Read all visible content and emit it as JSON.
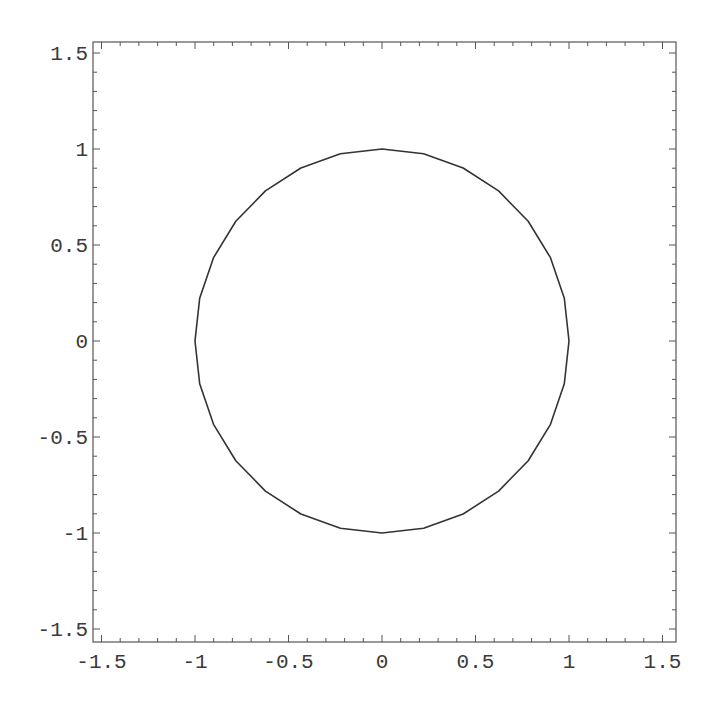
{
  "chart_data": {
    "type": "line",
    "title": "",
    "xlabel": "",
    "ylabel": "",
    "series": [
      {
        "name": "unit circle",
        "parametric": {
          "x": "cos(t)",
          "y": "sin(t)",
          "t_range": [
            0,
            6.2832
          ]
        },
        "segments": 28,
        "color": "#333333",
        "key_points": [
          {
            "x": 1,
            "y": 0
          },
          {
            "x": 0,
            "y": 1
          },
          {
            "x": -1,
            "y": 0
          },
          {
            "x": 0,
            "y": -1
          }
        ]
      }
    ],
    "xlim": [
      -1.55,
      1.57
    ],
    "ylim": [
      -1.57,
      1.56
    ],
    "xticks": [
      -1.5,
      -1,
      -0.5,
      0,
      0.5,
      1,
      1.5
    ],
    "yticks": [
      -1.5,
      -1,
      -0.5,
      0,
      0.5,
      1,
      1.5
    ],
    "xtick_labels": [
      "-1.5",
      "-1",
      "-0.5",
      "0",
      "0.5",
      "1",
      "1.5"
    ],
    "ytick_labels": [
      "-1.5",
      "-1",
      "-0.5",
      "0",
      "0.5",
      "1",
      "1.5"
    ],
    "minor_tick_step": 0.1,
    "frame": true,
    "grid": false,
    "legend": null,
    "aspect": "equal"
  },
  "colors": {
    "frame": "#555555",
    "curve": "#333333",
    "labels": "#3a3a3a",
    "background": "#ffffff"
  }
}
